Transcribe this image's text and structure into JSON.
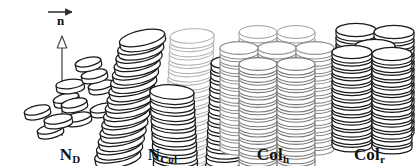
{
  "figure": {
    "background_color": "#ffffff",
    "stroke_color_dark": "#1a1a1a",
    "stroke_color_light": "#b4b4b4",
    "stroke_color_mid": "#8c8c8c",
    "fill_color": "#ffffff",
    "width": 419,
    "height": 166
  },
  "panels": [
    {
      "id": "nd",
      "label_main": "N",
      "label_sub": "D",
      "label_full": "N_D",
      "phase_name": "discotic nematic",
      "description": "Randomly positioned tilted discs with orientational order about a vertical director axis",
      "director": {
        "symbol": "n",
        "vector_arrow": "→",
        "axis_arrowhead": "hollow-up-arrow",
        "visible": true
      },
      "disc_count": 11,
      "stroke": "#1a1a1a",
      "discs": [
        {
          "cx": 66,
          "cy": 98,
          "rx": 13,
          "ry": 4.4,
          "rot": -14,
          "h": 5
        },
        {
          "cx": 37,
          "cy": 110,
          "rx": 13,
          "ry": 4.4,
          "rot": -13,
          "h": 5
        },
        {
          "cx": 78,
          "cy": 117,
          "rx": 13,
          "ry": 4.4,
          "rot": -12,
          "h": 5
        },
        {
          "cx": 50,
          "cy": 129,
          "rx": 13,
          "ry": 4.4,
          "rot": -13,
          "h": 5
        },
        {
          "cx": 70,
          "cy": 84,
          "rx": 14,
          "ry": 4.6,
          "rot": -7,
          "h": 5
        },
        {
          "cx": 101,
          "cy": 85,
          "rx": 13,
          "ry": 4.4,
          "rot": -12,
          "h": 5
        },
        {
          "cx": 94,
          "cy": 74,
          "rx": 13,
          "ry": 4.4,
          "rot": -12,
          "h": 5
        },
        {
          "cx": 88,
          "cy": 62,
          "rx": 13,
          "ry": 4.4,
          "rot": -12,
          "h": 5
        },
        {
          "cx": 103,
          "cy": 108,
          "rx": 13,
          "ry": 4.4,
          "rot": -12,
          "h": 5
        },
        {
          "cx": 74,
          "cy": 103,
          "rx": 13,
          "ry": 4.4,
          "rot": -12,
          "h": 5
        },
        {
          "cx": 58,
          "cy": 119,
          "rx": 14,
          "ry": 4.6,
          "rot": -9,
          "h": 5
        }
      ]
    },
    {
      "id": "ncol",
      "label_main": "N",
      "label_sub": "Col",
      "label_full": "N_Col",
      "phase_name": "columnar nematic",
      "description": "Columns of stacked discs with orientational order but no lateral positional order",
      "director": {
        "visible": false
      },
      "column_count": 4,
      "stroke": "#1a1a1a",
      "columns": [
        {
          "x": 142,
          "y": 38,
          "tilt": -12,
          "discs": 15,
          "rx": 23,
          "ry": 7.5,
          "step": 8.5,
          "stroke": "#1a1a1a",
          "width": 1.25
        },
        {
          "x": 192,
          "y": 36,
          "tilt": -3,
          "discs": 16,
          "rx": 22,
          "ry": 7.2,
          "step": 8.4,
          "stroke": "#b4b4b4",
          "width": 1.1
        },
        {
          "x": 232,
          "y": 62,
          "tilt": -3,
          "discs": 13,
          "rx": 21,
          "ry": 7.0,
          "step": 8.5,
          "stroke": "#1a1a1a",
          "width": 1.25
        },
        {
          "x": 172,
          "y": 92,
          "tilt": 3,
          "discs": 13,
          "rx": 22,
          "ry": 7.2,
          "step": 8.5,
          "stroke": "#1a1a1a",
          "width": 1.25
        }
      ]
    },
    {
      "id": "colh",
      "label_main": "Col",
      "label_sub": "h",
      "label_full": "Col_h",
      "phase_name": "hexagonal columnar",
      "description": "Parallel columns arranged on a hexagonal two-dimensional lattice",
      "director": {
        "visible": false
      },
      "column_count": 7,
      "lattice": "hexagonal",
      "rows": [
        2,
        3,
        2
      ],
      "stroke": "#8c8c8c",
      "columns": [
        {
          "x": 258,
          "y": 32,
          "discs": 14,
          "rx": 19,
          "ry": 6.4,
          "step": 7.4,
          "stroke": "#9a9a9a",
          "width": 1.0
        },
        {
          "x": 296,
          "y": 32,
          "discs": 14,
          "rx": 19,
          "ry": 6.4,
          "step": 7.4,
          "stroke": "#9a9a9a",
          "width": 1.0
        },
        {
          "x": 239,
          "y": 48,
          "discs": 14,
          "rx": 19,
          "ry": 6.4,
          "step": 7.4,
          "stroke": "#8c8c8c",
          "width": 1.05
        },
        {
          "x": 277,
          "y": 48,
          "discs": 14,
          "rx": 19,
          "ry": 6.4,
          "step": 7.4,
          "stroke": "#8c8c8c",
          "width": 1.05
        },
        {
          "x": 315,
          "y": 48,
          "discs": 14,
          "rx": 19,
          "ry": 6.4,
          "step": 7.4,
          "stroke": "#8c8c8c",
          "width": 1.05
        },
        {
          "x": 258,
          "y": 64,
          "discs": 14,
          "rx": 19,
          "ry": 6.4,
          "step": 7.4,
          "stroke": "#7a7a7a",
          "width": 1.1
        },
        {
          "x": 296,
          "y": 64,
          "discs": 14,
          "rx": 19,
          "ry": 6.4,
          "step": 7.4,
          "stroke": "#7a7a7a",
          "width": 1.1
        }
      ]
    },
    {
      "id": "colr",
      "label_main": "Col",
      "label_sub": "r",
      "label_full": "Col_r",
      "phase_name": "rectangular columnar",
      "description": "Parallel columns arranged on a rectangular two-dimensional lattice",
      "director": {
        "visible": false
      },
      "column_count": 5,
      "lattice": "rectangular",
      "stroke": "#1a1a1a",
      "columns": [
        {
          "x": 356,
          "y": 30,
          "discs": 14,
          "rx": 20,
          "ry": 6.6,
          "step": 7.4,
          "stroke": "#1a1a1a",
          "width": 1.2
        },
        {
          "x": 394,
          "y": 32,
          "discs": 14,
          "rx": 20,
          "ry": 6.6,
          "step": 7.4,
          "stroke": "#1a1a1a",
          "width": 1.2
        },
        {
          "x": 375,
          "y": 46,
          "discs": 13,
          "rx": 20,
          "ry": 6.6,
          "step": 7.4,
          "stroke": "#1a1a1a",
          "width": 1.2
        },
        {
          "x": 352,
          "y": 52,
          "discs": 13,
          "rx": 20,
          "ry": 6.6,
          "step": 7.4,
          "stroke": "#1a1a1a",
          "width": 1.25
        },
        {
          "x": 392,
          "y": 54,
          "discs": 13,
          "rx": 20,
          "ry": 6.6,
          "step": 7.4,
          "stroke": "#1a1a1a",
          "width": 1.25
        }
      ]
    }
  ]
}
